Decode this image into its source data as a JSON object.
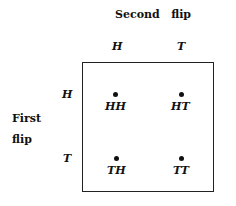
{
  "column_title": "Second   flip",
  "row_title_line1": "First",
  "row_title_line2": "flip",
  "columns": [
    "H",
    "T"
  ],
  "rows": [
    "H",
    "T"
  ],
  "outcomes": [
    [
      "HH",
      "HT"
    ],
    [
      "TH",
      "TT"
    ]
  ]
}
